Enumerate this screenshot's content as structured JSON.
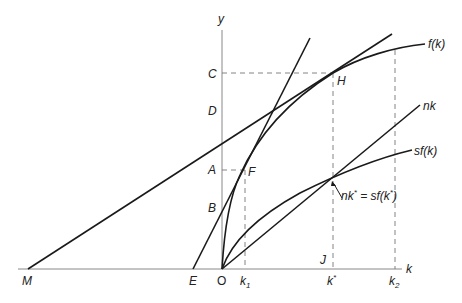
{
  "diagram": {
    "type": "Solow growth model diagram",
    "axes": {
      "x_label": "k",
      "y_label": "y",
      "origin_label": "O"
    },
    "curves": {
      "production": "f(k)",
      "savings": "sf(k)",
      "depreciation_line": "nk"
    },
    "annotation": {
      "equilibrium": "nk* = sf(k*)"
    },
    "points": {
      "y_axis": [
        "C",
        "D",
        "A",
        "B"
      ],
      "x_axis": [
        "M",
        "E",
        "O",
        "k1",
        "J",
        "k*",
        "k2"
      ],
      "curve_points": [
        "H",
        "F"
      ]
    },
    "labels": {
      "y": "y",
      "k": "k",
      "O": "O",
      "M": "M",
      "E": "E",
      "C": "C",
      "D": "D",
      "A": "A",
      "B": "B",
      "H": "H",
      "F": "F",
      "J": "J",
      "fk": "f(k)",
      "nk": "nk",
      "sfk": "sf(k)",
      "k1_base": "k",
      "k1_sub": "1",
      "kstar_base": "k",
      "kstar_sup": "*",
      "k2_base": "k",
      "k2_sub": "2",
      "eq_nk": "nk",
      "eq_star1": "*",
      "eq_mid": " = sf(k",
      "eq_star2": "*",
      "eq_end": ")"
    },
    "colors": {
      "curve": "#1a1a1a",
      "axis": "#888888",
      "dashed": "#777777",
      "background": "#ffffff"
    }
  }
}
